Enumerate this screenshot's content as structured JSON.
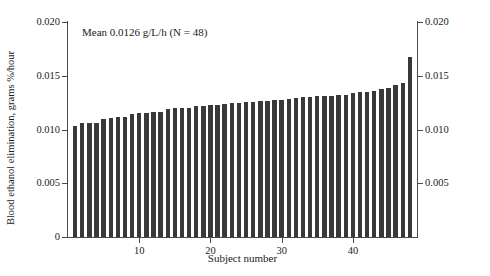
{
  "chart_data": {
    "type": "bar",
    "title": "",
    "annotation": "Mean 0.0126 g/L/h (N = 48)",
    "mean": 0.0126,
    "n": 48,
    "xlabel": "Subject number",
    "ylabel": "Blood ethanol elimination, grams %/hour",
    "ylim": [
      0,
      0.02
    ],
    "yticks": [
      0,
      0.005,
      0.01,
      0.015,
      0.02
    ],
    "ytick_labels": [
      "0",
      "0.005",
      "0.010",
      "0.015",
      "0.020"
    ],
    "yticks_right": [
      0.005,
      0.01,
      0.015,
      0.02
    ],
    "ytick_labels_right": [
      "0.005",
      "0.010",
      "0.015",
      "0.020"
    ],
    "xticks": [
      10,
      20,
      30,
      40
    ],
    "xtick_labels": [
      "10",
      "20",
      "30",
      "40"
    ],
    "xlim": [
      0,
      49
    ],
    "grid": false,
    "legend": null,
    "bar_color": "#393939",
    "axis_color": "#4a4a4a",
    "categories": [
      1,
      2,
      3,
      4,
      5,
      6,
      7,
      8,
      9,
      10,
      11,
      12,
      13,
      14,
      15,
      16,
      17,
      18,
      19,
      20,
      21,
      22,
      23,
      24,
      25,
      26,
      27,
      28,
      29,
      30,
      31,
      32,
      33,
      34,
      35,
      36,
      37,
      38,
      39,
      40,
      41,
      42,
      43,
      44,
      45,
      46,
      47,
      48
    ],
    "values": [
      0.0103,
      0.0106,
      0.0106,
      0.0106,
      0.01095,
      0.0111,
      0.0112,
      0.0112,
      0.01145,
      0.01155,
      0.01155,
      0.0116,
      0.0116,
      0.01195,
      0.012,
      0.012,
      0.012,
      0.01215,
      0.0122,
      0.01225,
      0.01225,
      0.0124,
      0.01245,
      0.0125,
      0.01255,
      0.0126,
      0.01265,
      0.01265,
      0.0127,
      0.01275,
      0.01285,
      0.01295,
      0.013,
      0.01305,
      0.0131,
      0.0131,
      0.01315,
      0.0132,
      0.0132,
      0.0134,
      0.01345,
      0.0135,
      0.01355,
      0.01375,
      0.0139,
      0.01415,
      0.01435,
      0.0167
    ]
  }
}
